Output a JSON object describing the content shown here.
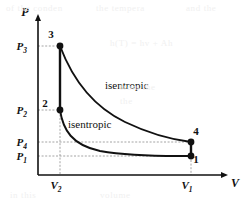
{
  "figure": {
    "kind": "pv-diagram",
    "background_color": "#ffffff",
    "ink_color": "#111111",
    "guide_color": "#9a9a9a",
    "bleed_through_text": [
      {
        "text": "of the conden",
        "x": 6,
        "y": 3
      },
      {
        "text": "the tempera",
        "x": 96,
        "y": 3
      },
      {
        "text": "and the",
        "x": 186,
        "y": 3
      },
      {
        "text": "h(T) =  hv  + Ah",
        "x": 110,
        "y": 38
      },
      {
        "text": "from the",
        "x": 120,
        "y": 82
      },
      {
        "text": "the",
        "x": 120,
        "y": 96
      },
      {
        "text": "in this",
        "x": 10,
        "y": 190
      },
      {
        "text": "volume",
        "x": 100,
        "y": 190
      }
    ]
  },
  "axes": {
    "y_label": "P",
    "x_label": "V",
    "y_axis_x": 38,
    "x_axis_y": 175,
    "y_arrow_tip_y": 14,
    "x_arrow_tip_x": 228,
    "y_tick_labels": [
      {
        "base": "P",
        "sub": "3",
        "value_y": 46
      },
      {
        "base": "P",
        "sub": "2",
        "value_y": 110
      },
      {
        "base": "P",
        "sub": "4",
        "value_y": 142
      },
      {
        "base": "P",
        "sub": "1",
        "value_y": 156
      }
    ],
    "x_tick_labels": [
      {
        "base": "V",
        "sub": "2",
        "value_x": 60
      },
      {
        "base": "V",
        "sub": "1",
        "value_x": 191
      }
    ]
  },
  "chart_data": {
    "type": "line",
    "title": "",
    "xlabel": "V",
    "ylabel": "P",
    "grid": false,
    "legend": "none",
    "xlim": [
      38,
      228
    ],
    "ylim": [
      175,
      14
    ],
    "x_tick_values": [
      "V2",
      "V1"
    ],
    "y_tick_values": [
      "P1",
      "P4",
      "P2",
      "P3"
    ],
    "points": [
      {
        "id": "3",
        "label": "3",
        "x": 60,
        "y": 46,
        "label_dx": -9,
        "label_dy": -8
      },
      {
        "id": "2",
        "label": "2",
        "x": 60,
        "y": 110,
        "label_dx": -15,
        "label_dy": -3
      },
      {
        "id": "4",
        "label": "4",
        "x": 191,
        "y": 142,
        "label_dx": 5,
        "label_dy": -7
      },
      {
        "id": "1",
        "label": "1",
        "x": 191,
        "y": 156,
        "label_dx": 5,
        "label_dy": 7
      }
    ],
    "processes": [
      {
        "name": "compression-3-2",
        "from": "3",
        "to": "2",
        "kind": "vertical",
        "path": "M 60 46 L 60 110"
      },
      {
        "name": "isentropic-expansion-3-4",
        "from": "3",
        "to": "4",
        "kind": "isentropic",
        "label": "isentropic",
        "label_x": 105,
        "label_y": 89,
        "path": "M 60 46 C 72 78, 92 106, 125 122 C 152 135, 175 140, 191 142"
      },
      {
        "name": "expansion-4-1",
        "from": "4",
        "to": "1",
        "kind": "vertical",
        "path": "M 191 142 L 191 156"
      },
      {
        "name": "isentropic-compression-2-1",
        "from": "2",
        "to": "1",
        "kind": "isentropic",
        "label": "isentropic",
        "label_x": 68,
        "label_y": 128,
        "path": "M 60 110 C 63 130, 72 145, 100 151 C 135 157, 170 156, 191 156"
      }
    ],
    "guide_lines": [
      {
        "name": "p3-guide",
        "orientation": "horizontal",
        "from_x": 38,
        "to_x": 60,
        "y": 46
      },
      {
        "name": "p2-guide",
        "orientation": "horizontal",
        "from_x": 38,
        "to_x": 60,
        "y": 110
      },
      {
        "name": "p4-guide",
        "orientation": "horizontal",
        "from_x": 38,
        "to_x": 191,
        "y": 142
      },
      {
        "name": "p1-guide",
        "orientation": "horizontal",
        "from_x": 38,
        "to_x": 191,
        "y": 156
      },
      {
        "name": "v2-guide",
        "orientation": "vertical",
        "from_y": 46,
        "to_y": 175,
        "x": 60
      },
      {
        "name": "v1-guide",
        "orientation": "vertical",
        "from_y": 142,
        "to_y": 175,
        "x": 191
      }
    ]
  }
}
